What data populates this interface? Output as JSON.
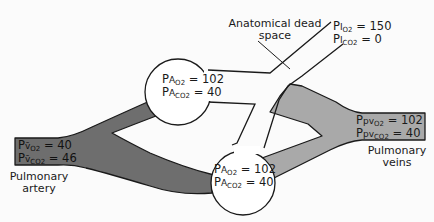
{
  "diagram": {
    "colors": {
      "pulmonary_artery_fill": "#6e6e6e",
      "pulmonary_vein_fill": "#a9a9a9",
      "outline": "#1a1a1a",
      "alveolus_fill": "#ffffff",
      "background": "#fbfbfb"
    },
    "labels": {
      "dead_space_line1": "Anatomical dead",
      "dead_space_line2": "space",
      "pulmonary_artery_line1": "Pulmonary",
      "pulmonary_artery_line2": "artery",
      "pulmonary_veins_line1": "Pulmonary",
      "pulmonary_veins_line2": "veins"
    },
    "inspired": {
      "o2": {
        "prefix": "P",
        "site": "I",
        "gas": "O",
        "gas_sub": "2",
        "value": "150"
      },
      "co2": {
        "prefix": "P",
        "site": "I",
        "gas": "CO",
        "gas_sub": "2",
        "value": "0"
      }
    },
    "alveolus_upper": {
      "o2": {
        "prefix": "P",
        "site": "A",
        "gas": "O",
        "gas_sub": "2",
        "value": "102"
      },
      "co2": {
        "prefix": "P",
        "site": "A",
        "gas": "CO",
        "gas_sub": "2",
        "value": "40"
      }
    },
    "alveolus_lower": {
      "o2": {
        "prefix": "P",
        "site": "A",
        "gas": "O",
        "gas_sub": "2",
        "value": "102"
      },
      "co2": {
        "prefix": "P",
        "site": "A",
        "gas": "CO",
        "gas_sub": "2",
        "value": "40"
      }
    },
    "mixed_venous": {
      "o2": {
        "prefix": "P",
        "site": "v̄",
        "gas": "O",
        "gas_sub": "2",
        "value": "40"
      },
      "co2": {
        "prefix": "P",
        "site": "v̄",
        "gas": "CO",
        "gas_sub": "2",
        "value": "46"
      }
    },
    "pulmonary_venous": {
      "o2": {
        "prefix": "P",
        "site": "pv",
        "gas": "O",
        "gas_sub": "2",
        "value": "102"
      },
      "co2": {
        "prefix": "P",
        "site": "pv",
        "gas": "CO",
        "gas_sub": "2",
        "value": "40"
      }
    },
    "equals": "="
  }
}
